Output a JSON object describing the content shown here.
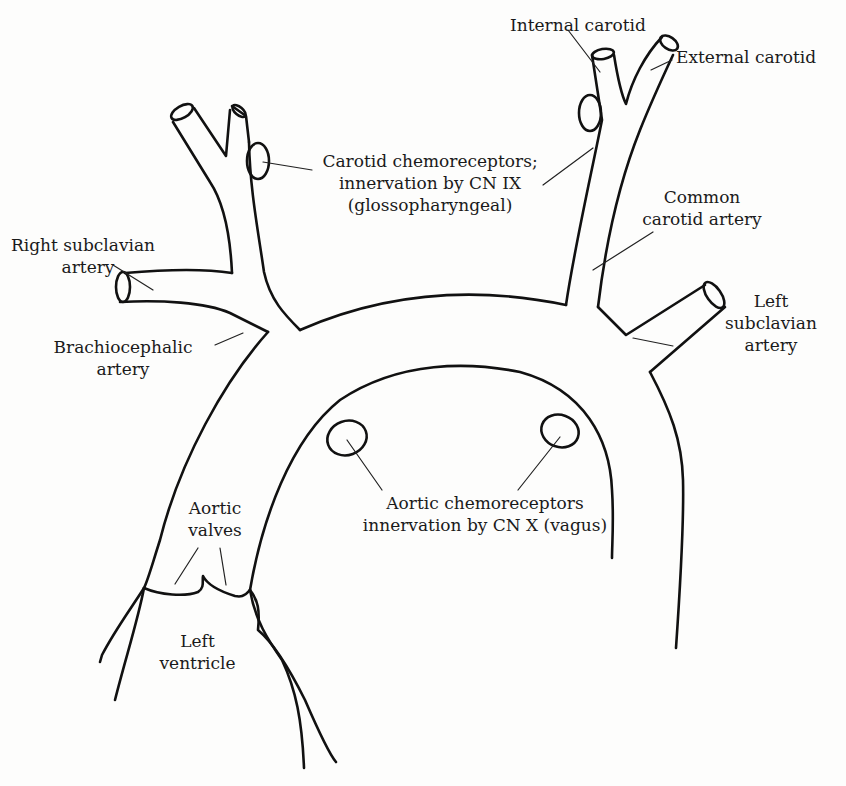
{
  "diagram": {
    "stroke_color": "#111111",
    "background_color": "#fdfdfc",
    "labels": {
      "internal_carotid": "Internal carotid",
      "external_carotid": "External carotid",
      "carotid_chemoreceptors": {
        "line1": "Carotid chemoreceptors;",
        "line2": "innervation by CN IX",
        "line3": "(glossopharyngeal)"
      },
      "common_carotid": {
        "line1": "Common",
        "line2": "carotid artery"
      },
      "right_subclavian": {
        "line1": "Right subclavian",
        "line2": "artery"
      },
      "brachiocephalic": {
        "line1": "Brachiocephalic",
        "line2": "artery"
      },
      "left_subclavian": {
        "line1": "Left",
        "line2": "subclavian",
        "line3": "artery"
      },
      "aortic_chemoreceptors": {
        "line1": "Aortic chemoreceptors",
        "line2": "innervation by CN X (vagus)"
      },
      "aortic_valves": {
        "line1": "Aortic",
        "line2": "valves"
      },
      "left_ventricle": {
        "line1": "Left",
        "line2": "ventricle"
      }
    }
  }
}
